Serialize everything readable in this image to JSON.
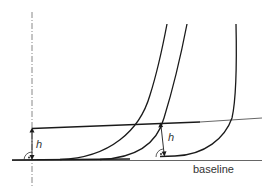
{
  "diagram": {
    "labels": {
      "h_left": "h",
      "h_right": "h",
      "baseline": "baseline"
    },
    "colors": {
      "stroke": "#1a1a1a",
      "axis": "#777777",
      "thin_line": "#555555",
      "background": "#ffffff"
    },
    "elements": {
      "vertical_axis": "dash-dot vertical reference line",
      "baseline": "horizontal baseline",
      "measurement_line": "slightly slanted straight line",
      "curves": [
        "left curve",
        "middle curve",
        "right curve"
      ],
      "height_markers": [
        "perpendicular h from axis to slanted line",
        "perpendicular h from baseline point to slanted line"
      ],
      "right_angle_markers": 2
    }
  }
}
